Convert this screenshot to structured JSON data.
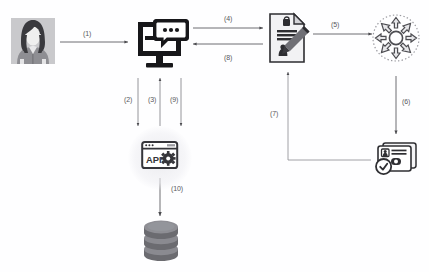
{
  "diagram": {
    "background_color": "#fefeff",
    "label_color": "#58585c",
    "nodes": [
      {
        "id": "user",
        "icon": "user-avatar-icon",
        "label": ""
      },
      {
        "id": "workstation",
        "icon": "monitor-chat-icon",
        "label": ""
      },
      {
        "id": "document",
        "icon": "signed-document-pen-icon",
        "label": ""
      },
      {
        "id": "hub",
        "icon": "radial-distribution-icon",
        "label": ""
      },
      {
        "id": "credential",
        "icon": "id-card-verified-icon",
        "label": ""
      },
      {
        "id": "api",
        "icon": "api-gear-window-icon",
        "label": "API"
      },
      {
        "id": "database",
        "icon": "database-stack-icon",
        "label": ""
      }
    ],
    "edges": [
      {
        "id": "e1",
        "label": "(1)",
        "from": "user",
        "to": "workstation",
        "direction": "right"
      },
      {
        "id": "e2",
        "label": "(2)",
        "from": "workstation",
        "to": "api",
        "direction": "down"
      },
      {
        "id": "e3",
        "label": "(3)",
        "from": "api",
        "to": "workstation",
        "direction": "up"
      },
      {
        "id": "e4",
        "label": "(4)",
        "from": "workstation",
        "to": "document",
        "direction": "right"
      },
      {
        "id": "e5",
        "label": "(5)",
        "from": "document",
        "to": "hub",
        "direction": "right"
      },
      {
        "id": "e6",
        "label": "(6)",
        "from": "hub",
        "to": "credential",
        "direction": "down"
      },
      {
        "id": "e7",
        "label": "(7)",
        "from": "credential",
        "to": "document",
        "direction": "left-up"
      },
      {
        "id": "e8",
        "label": "(8)",
        "from": "document",
        "to": "workstation",
        "direction": "left"
      },
      {
        "id": "e9",
        "label": "(9)",
        "from": "workstation",
        "to": "api",
        "direction": "down"
      },
      {
        "id": "e10",
        "label": "(10)",
        "from": "api",
        "to": "database",
        "direction": "down"
      }
    ]
  }
}
